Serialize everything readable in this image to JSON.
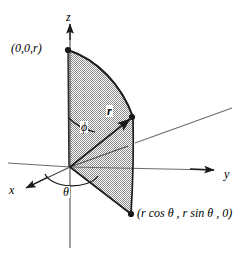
{
  "figure": {
    "type": "math-diagram",
    "colors": {
      "stroke": "#1a1a1a",
      "fill_dark": "#808080",
      "fill_light": "#ffffff",
      "background": "#ffffff",
      "axis": "#555555"
    },
    "axes": [
      {
        "name": "z",
        "label": "z",
        "direction": "up",
        "label_pos": {
          "x": 66,
          "y": 13
        }
      },
      {
        "name": "y",
        "label": "y",
        "direction": "right",
        "label_pos": {
          "x": 224,
          "y": 170
        }
      },
      {
        "name": "x",
        "label": "x",
        "direction": "down-left",
        "label_pos": {
          "x": 9,
          "y": 186
        }
      }
    ],
    "points": [
      {
        "name": "top-point",
        "label": "(0,0,r)",
        "label_pos": {
          "x": 11,
          "y": 42
        },
        "dot": {
          "x": 68,
          "y": 50
        }
      },
      {
        "name": "arc-point",
        "label": "",
        "dot": {
          "x": 133,
          "y": 117
        }
      },
      {
        "name": "bottom-point",
        "label": "(r cos θ , r sin θ , 0)",
        "label_pos": {
          "x": 136,
          "y": 212
        },
        "dot": {
          "x": 131,
          "y": 214
        }
      }
    ],
    "angles": [
      {
        "name": "phi",
        "label": "ϕ",
        "label_pos": {
          "x": 81,
          "y": 127
        },
        "description": "angle from positive z-axis to radius vector"
      },
      {
        "name": "theta",
        "label": "θ",
        "label_pos": {
          "x": 63,
          "y": 190
        },
        "description": "angle in xy-plane from x-axis"
      }
    ],
    "vectors": [
      {
        "name": "radius",
        "label": "r",
        "label_pos": {
          "x": 107,
          "y": 110
        },
        "from": {
          "x": 70,
          "y": 167
        },
        "to": {
          "x": 133,
          "y": 117
        }
      }
    ],
    "origin": {
      "x": 70,
      "y": 167
    },
    "shaded_region": {
      "name": "spherical-sector",
      "fill": "checkerboard-gray",
      "description": "quarter disc of radius r above xy-plane plus triangular wedge below"
    }
  }
}
